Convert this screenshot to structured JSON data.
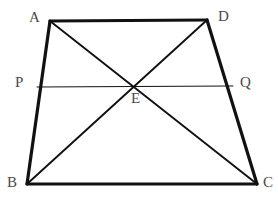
{
  "figure": {
    "type": "geometry-diagram",
    "shape": "trapezoid-with-diagonals",
    "background_color": "#ffffff",
    "stroke_color": "#111111",
    "label_color": "#4a4a4a",
    "canvas": {
      "width": 278,
      "height": 204
    }
  },
  "points": {
    "A": {
      "label": "A",
      "x": 50,
      "y": 21,
      "label_x": 29,
      "label_y": 10
    },
    "D": {
      "label": "D",
      "x": 207,
      "y": 20,
      "label_x": 218,
      "label_y": 9
    },
    "B": {
      "label": "B",
      "x": 27,
      "y": 184,
      "label_x": 7,
      "label_y": 175
    },
    "C": {
      "label": "C",
      "x": 257,
      "y": 184,
      "label_x": 263,
      "label_y": 175
    },
    "P": {
      "label": "P",
      "x": 37,
      "y": 87,
      "label_x": 15,
      "label_y": 75
    },
    "Q": {
      "label": "Q",
      "x": 233,
      "y": 86,
      "label_x": 240,
      "label_y": 75
    },
    "E": {
      "label": "E",
      "x": 136,
      "y": 85,
      "label_x": 131,
      "label_y": 91
    }
  },
  "segments": [
    {
      "name": "side-AD",
      "from": "A",
      "to": "D",
      "width": 3.2
    },
    {
      "name": "side-AB",
      "from": "A",
      "to": "B",
      "width": 3.2
    },
    {
      "name": "side-DC",
      "from": "D",
      "to": "C",
      "width": 3.2
    },
    {
      "name": "side-BC",
      "from": "B",
      "to": "C",
      "width": 3.2
    },
    {
      "name": "diagonal-AC",
      "from": "A",
      "to": "C",
      "width": 1.9
    },
    {
      "name": "diagonal-BD",
      "from": "B",
      "to": "D",
      "width": 1.9
    },
    {
      "name": "midline-PQ",
      "from": "P",
      "to": "Q",
      "width": 1.0
    }
  ]
}
